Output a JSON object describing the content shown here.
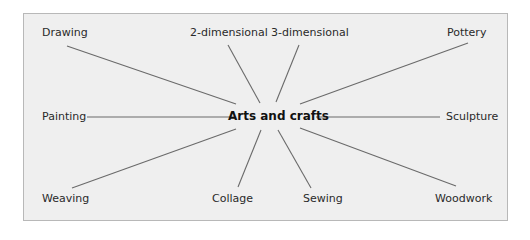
{
  "diagram": {
    "type": "spider-diagram",
    "center": "Arts and crafts",
    "nodes": [
      {
        "label": "Drawing"
      },
      {
        "label": "2-dimensional"
      },
      {
        "label": "3-dimensional"
      },
      {
        "label": "Pottery"
      },
      {
        "label": "Painting"
      },
      {
        "label": "Sculpture"
      },
      {
        "label": "Weaving"
      },
      {
        "label": "Collage"
      },
      {
        "label": "Sewing"
      },
      {
        "label": "Woodwork"
      }
    ],
    "colors": {
      "panel": "#efefef",
      "border": "#b8b8b8",
      "line": "#6a6a6a",
      "text": "#2a2a2a"
    }
  }
}
